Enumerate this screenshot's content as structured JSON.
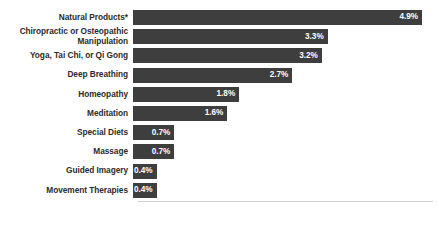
{
  "chart_data": {
    "type": "bar",
    "orientation": "horizontal",
    "title": "",
    "subtitle": "",
    "xlabel": "",
    "ylabel": "",
    "grid": false,
    "legend": null,
    "xlim": [
      0,
      5.0
    ],
    "value_suffix": "%",
    "categories": [
      "Natural Products*",
      "Chiropractic or Osteopathic\nManipulation",
      "Yoga, Tai Chi, or Qi Gong",
      "Deep Breathing",
      "Homeopathy",
      "Meditation",
      "Special Diets",
      "Massage",
      "Guided Imagery",
      "Movement Therapies"
    ],
    "values": [
      4.9,
      3.3,
      3.2,
      2.7,
      1.8,
      1.6,
      0.7,
      0.7,
      0.4,
      0.4
    ],
    "value_labels": [
      "4.9%",
      "3.3%",
      "3.2%",
      "2.7%",
      "1.8%",
      "1.6%",
      "0.7%",
      "0.7%",
      "0.4%",
      "0.4%"
    ],
    "colors": {
      "bar": "#3e3e3e",
      "value_text": "#ffffff",
      "category_text": "#2b2b2b",
      "background": "#ffffff",
      "axis_line": "#d2d2d2"
    }
  },
  "bars": [
    {
      "label": "Natural Products*",
      "value_label": "4.9%",
      "value": 4.9
    },
    {
      "label": "Chiropractic or Osteopathic\nManipulation",
      "value_label": "3.3%",
      "value": 3.3
    },
    {
      "label": "Yoga, Tai Chi, or Qi Gong",
      "value_label": "3.2%",
      "value": 3.2
    },
    {
      "label": "Deep Breathing",
      "value_label": "2.7%",
      "value": 2.7
    },
    {
      "label": "Homeopathy",
      "value_label": "1.8%",
      "value": 1.8
    },
    {
      "label": "Meditation",
      "value_label": "1.6%",
      "value": 1.6
    },
    {
      "label": "Special Diets",
      "value_label": "0.7%",
      "value": 0.7
    },
    {
      "label": "Massage",
      "value_label": "0.7%",
      "value": 0.7
    },
    {
      "label": "Guided Imagery",
      "value_label": "0.4%",
      "value": 0.4
    },
    {
      "label": "Movement Therapies",
      "value_label": "0.4%",
      "value": 0.4
    }
  ]
}
